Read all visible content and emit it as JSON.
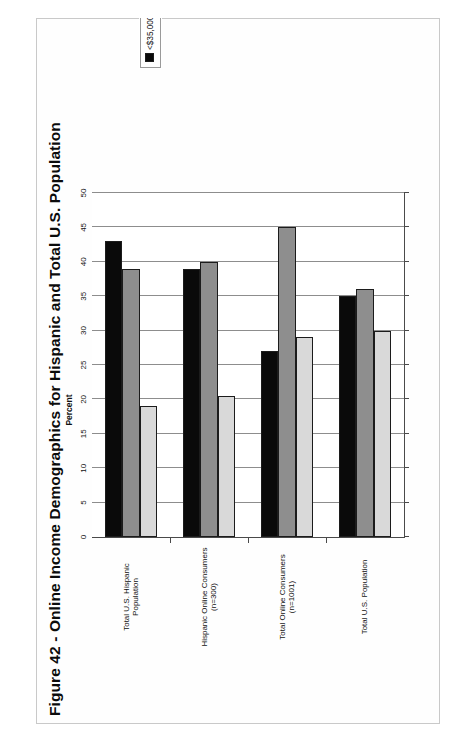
{
  "figure": {
    "caption": "Figure 42 - Online Income Demographics for Hispanic and Total U.S. Population"
  },
  "chart_data": {
    "type": "bar",
    "orientation": "horizontal",
    "title": "Figure 42 - Online Income Demographics for Hispanic and Total U.S. Population",
    "xlabel": "Percent",
    "ylabel": "",
    "xlim": [
      0,
      50
    ],
    "xticks": [
      0,
      5,
      10,
      15,
      20,
      25,
      30,
      35,
      40,
      45,
      50
    ],
    "grid": true,
    "legend_position": "right",
    "categories": [
      "Total U.S. Hispanic Population",
      "Hispanic Online Consumers (n=300)",
      "Total Online Consumers (n=1001)",
      "Total U.S. Population"
    ],
    "category_lines": [
      [
        "Total U.S. Hispanic",
        "Population"
      ],
      [
        "Hispanic Online Consumers",
        "(n=300)"
      ],
      [
        "Total Online Consumers",
        "(n=1001)"
      ],
      [
        "Total U.S. Population"
      ]
    ],
    "series": [
      {
        "name": "<$35,000",
        "color": "#0a0a0a",
        "values": [
          43,
          39,
          27,
          35
        ]
      },
      {
        "name": "$35,000-$74,999",
        "color": "#8e8e8e",
        "values": [
          39,
          40,
          45,
          36
        ]
      },
      {
        "name": "$75,000 or more",
        "color": "#d9d9d9",
        "values": [
          19,
          20.5,
          29,
          30
        ]
      }
    ]
  },
  "legend": {
    "items": [
      {
        "label": "<$35,000",
        "swatch": "black-swatch-icon"
      },
      {
        "label": "$35,000-$74,999",
        "swatch": "gray-swatch-icon"
      },
      {
        "label": "$75,000 or more",
        "swatch": "lightgray-swatch-icon"
      }
    ]
  },
  "axis": {
    "title": "Percent",
    "ticks": [
      "0",
      "5",
      "10",
      "15",
      "20",
      "25",
      "30",
      "35",
      "40",
      "45",
      "50"
    ]
  }
}
